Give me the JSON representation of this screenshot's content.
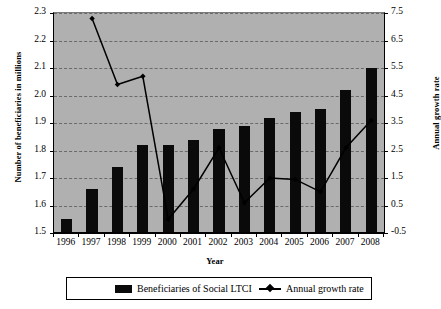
{
  "chart_data": {
    "type": "bar",
    "title": "",
    "xlabel": "Year",
    "ylabel": "Number of beneficiaries in millions",
    "y2label": "Annual growth rate",
    "categories": [
      "1996",
      "1997",
      "1998",
      "1999",
      "2000",
      "2001",
      "2002",
      "2003",
      "2004",
      "2005",
      "2006",
      "2007",
      "2008"
    ],
    "ylim": [
      1.5,
      2.3
    ],
    "y2lim": [
      -0.5,
      7.5
    ],
    "yticks": [
      "1.5",
      "1.6",
      "1.7",
      "1.8",
      "1.9",
      "2.0",
      "2.1",
      "2.2",
      "2.3"
    ],
    "y2ticks": [
      "-0.5",
      "0.5",
      "1.5",
      "2.5",
      "3.5",
      "4.5",
      "5.5",
      "6.5",
      "7.5"
    ],
    "grid": true,
    "legend_position": "bottom",
    "series": [
      {
        "name": "Beneficiaries of Social LTCI",
        "type": "bar",
        "axis": "left",
        "color": "#0a0a0a",
        "values": [
          1.55,
          1.66,
          1.74,
          1.82,
          1.82,
          1.84,
          1.88,
          1.89,
          1.92,
          1.94,
          1.95,
          2.02,
          2.1
        ]
      },
      {
        "name": "Annual growth rate",
        "type": "line",
        "axis": "right",
        "color": "#000000",
        "marker": "diamond",
        "values": [
          null,
          7.3,
          4.9,
          5.2,
          0.0,
          1.1,
          2.6,
          0.6,
          1.5,
          1.45,
          1.0,
          2.6,
          3.6
        ]
      }
    ]
  },
  "plot": {
    "background_color": "#b0b0b0",
    "gridline_color": "#6a6a6a"
  },
  "legend": {
    "items": [
      {
        "label": "Beneficiaries of Social LTCI",
        "marker": "bar-swatch"
      },
      {
        "label": "Annual growth rate",
        "marker": "line-diamond"
      }
    ]
  }
}
